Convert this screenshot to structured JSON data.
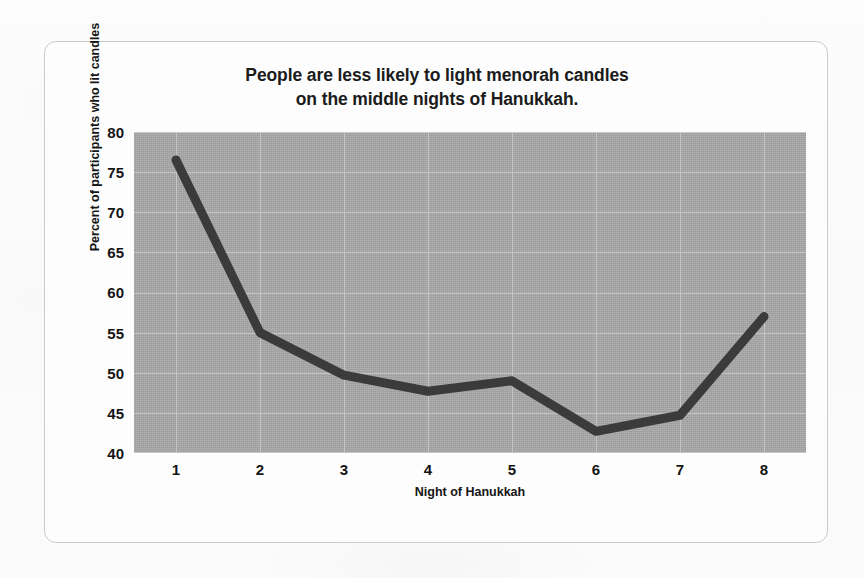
{
  "chart_data": {
    "type": "line",
    "title": "People are less likely to light menorah candles on the middle nights of Hanukkah.",
    "title_lines": [
      "People are less likely to light menorah candles",
      "on the middle nights of Hanukkah."
    ],
    "xlabel": "Night of Hanukkah",
    "ylabel": "Percent of participants who lit candles",
    "x": [
      1,
      2,
      3,
      4,
      5,
      6,
      7,
      8
    ],
    "categories": [
      "1",
      "2",
      "3",
      "4",
      "5",
      "6",
      "7",
      "8"
    ],
    "values": [
      76.5,
      55.0,
      49.7,
      47.7,
      49.0,
      42.7,
      44.7,
      57.0
    ],
    "xtick_labels": [
      "1",
      "2",
      "3",
      "4",
      "5",
      "6",
      "7",
      "8"
    ],
    "ytick_labels": [
      "80",
      "75",
      "70",
      "65",
      "60",
      "55",
      "50",
      "45",
      "40"
    ],
    "ytick_values": [
      80,
      75,
      70,
      65,
      60,
      55,
      50,
      45,
      40
    ],
    "ylim": [
      40,
      80
    ],
    "xlim": [
      0.5,
      8.5
    ],
    "grid": true,
    "legend": "none",
    "series_color": "#3b3b3b",
    "plot_background": "#a8a8a8",
    "gridline_color": "#c9c9c9",
    "card_background": "#fdfdfd",
    "card_border_color": "#c9cbcd",
    "page_background": "#fbfbfb",
    "text_color": "#141414",
    "line_width_px": 9
  }
}
